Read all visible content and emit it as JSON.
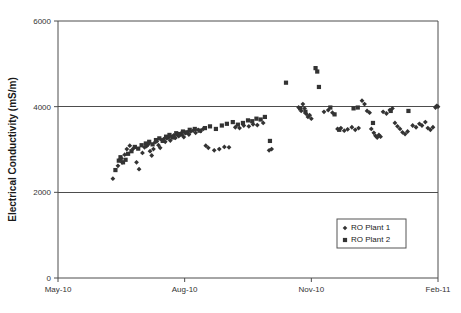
{
  "chart_data": {
    "type": "scatter",
    "title": "",
    "xlabel": "",
    "ylabel": "Electrical Conductivity (mS/m)",
    "grid": true,
    "legend_position": "inside-bottom-right",
    "ylim": [
      0,
      6000
    ],
    "y_ticks": [
      0,
      2000,
      4000,
      6000
    ],
    "y_tick_labels": [
      "0",
      "2000",
      "4000",
      "6000"
    ],
    "x_ticks": [
      0,
      3,
      6,
      9
    ],
    "x_tick_labels": [
      "May-10",
      "Aug-10",
      "Nov-10",
      "Feb-11"
    ],
    "xlim": [
      0,
      9
    ],
    "x_unit": "months since May-10",
    "series": [
      {
        "name": "RO Plant 1",
        "marker": "diamond",
        "color": "#333333",
        "points": [
          [
            1.3,
            2320
          ],
          [
            1.42,
            2620
          ],
          [
            1.46,
            2760
          ],
          [
            1.5,
            2790
          ],
          [
            1.52,
            2700
          ],
          [
            1.58,
            2880
          ],
          [
            1.63,
            3010
          ],
          [
            1.7,
            3090
          ],
          [
            1.78,
            3020
          ],
          [
            1.86,
            2700
          ],
          [
            1.92,
            2540
          ],
          [
            2.0,
            2920
          ],
          [
            2.05,
            3050
          ],
          [
            2.1,
            3080
          ],
          [
            2.14,
            3120
          ],
          [
            2.18,
            2960
          ],
          [
            2.22,
            2860
          ],
          [
            2.26,
            3010
          ],
          [
            2.3,
            3170
          ],
          [
            2.34,
            3190
          ],
          [
            2.38,
            3100
          ],
          [
            2.42,
            3040
          ],
          [
            2.46,
            3220
          ],
          [
            2.5,
            3240
          ],
          [
            2.54,
            3180
          ],
          [
            2.58,
            3260
          ],
          [
            2.62,
            3280
          ],
          [
            2.66,
            3210
          ],
          [
            2.7,
            3300
          ],
          [
            2.74,
            3330
          ],
          [
            2.78,
            3270
          ],
          [
            2.82,
            3350
          ],
          [
            2.86,
            3310
          ],
          [
            2.9,
            3370
          ],
          [
            2.94,
            3340
          ],
          [
            2.98,
            3290
          ],
          [
            3.02,
            3380
          ],
          [
            3.06,
            3400
          ],
          [
            3.1,
            3350
          ],
          [
            3.14,
            3420
          ],
          [
            3.2,
            3440
          ],
          [
            3.26,
            3390
          ],
          [
            3.32,
            3460
          ],
          [
            3.38,
            3430
          ],
          [
            3.44,
            3480
          ],
          [
            3.5,
            3090
          ],
          [
            3.56,
            3040
          ],
          [
            3.7,
            2980
          ],
          [
            3.82,
            3010
          ],
          [
            3.94,
            3060
          ],
          [
            4.05,
            3050
          ],
          [
            4.2,
            3520
          ],
          [
            4.3,
            3500
          ],
          [
            4.4,
            3560
          ],
          [
            4.52,
            3540
          ],
          [
            4.62,
            3590
          ],
          [
            4.72,
            3570
          ],
          [
            4.86,
            3620
          ],
          [
            5.0,
            2980
          ],
          [
            5.06,
            3010
          ],
          [
            5.7,
            3980
          ],
          [
            5.76,
            3900
          ],
          [
            5.8,
            4060
          ],
          [
            5.84,
            3960
          ],
          [
            5.88,
            3830
          ],
          [
            5.92,
            3760
          ],
          [
            5.96,
            3800
          ],
          [
            6.0,
            3720
          ],
          [
            6.3,
            3880
          ],
          [
            6.4,
            3920
          ],
          [
            6.5,
            3860
          ],
          [
            6.62,
            3480
          ],
          [
            6.7,
            3500
          ],
          [
            6.78,
            3440
          ],
          [
            6.86,
            3470
          ],
          [
            6.96,
            3520
          ],
          [
            7.04,
            3460
          ],
          [
            7.12,
            3500
          ],
          [
            7.2,
            4140
          ],
          [
            7.26,
            4060
          ],
          [
            7.32,
            3900
          ],
          [
            7.38,
            3860
          ],
          [
            7.42,
            3480
          ],
          [
            7.48,
            3390
          ],
          [
            7.52,
            3320
          ],
          [
            7.56,
            3280
          ],
          [
            7.6,
            3340
          ],
          [
            7.64,
            3300
          ],
          [
            7.7,
            3880
          ],
          [
            7.78,
            3840
          ],
          [
            7.86,
            3920
          ],
          [
            7.92,
            3960
          ],
          [
            7.98,
            3620
          ],
          [
            8.04,
            3540
          ],
          [
            8.1,
            3480
          ],
          [
            8.16,
            3400
          ],
          [
            8.22,
            3360
          ],
          [
            8.28,
            3420
          ],
          [
            8.4,
            3560
          ],
          [
            8.48,
            3520
          ],
          [
            8.56,
            3600
          ],
          [
            8.62,
            3560
          ],
          [
            8.7,
            3640
          ],
          [
            8.76,
            3500
          ],
          [
            8.82,
            3460
          ],
          [
            8.88,
            3520
          ],
          [
            8.94,
            3980
          ],
          [
            8.97,
            4020
          ],
          [
            9.0,
            4000
          ]
        ]
      },
      {
        "name": "RO Plant 2",
        "marker": "square",
        "color": "#333333",
        "points": [
          [
            1.36,
            2520
          ],
          [
            1.44,
            2740
          ],
          [
            1.48,
            2820
          ],
          [
            1.54,
            2700
          ],
          [
            1.6,
            2760
          ],
          [
            1.66,
            2900
          ],
          [
            1.74,
            2960
          ],
          [
            1.82,
            3060
          ],
          [
            1.9,
            3020
          ],
          [
            1.98,
            3100
          ],
          [
            2.08,
            3140
          ],
          [
            2.16,
            3180
          ],
          [
            2.24,
            3120
          ],
          [
            2.32,
            3220
          ],
          [
            2.4,
            3260
          ],
          [
            2.48,
            3200
          ],
          [
            2.56,
            3300
          ],
          [
            2.64,
            3340
          ],
          [
            2.72,
            3280
          ],
          [
            2.8,
            3380
          ],
          [
            2.88,
            3360
          ],
          [
            2.96,
            3420
          ],
          [
            3.04,
            3400
          ],
          [
            3.12,
            3460
          ],
          [
            3.24,
            3480
          ],
          [
            3.36,
            3440
          ],
          [
            3.48,
            3500
          ],
          [
            3.6,
            3540
          ],
          [
            3.74,
            3480
          ],
          [
            3.88,
            3560
          ],
          [
            4.0,
            3600
          ],
          [
            4.14,
            3640
          ],
          [
            4.26,
            3580
          ],
          [
            4.38,
            3620
          ],
          [
            4.5,
            3680
          ],
          [
            4.6,
            3660
          ],
          [
            4.7,
            3720
          ],
          [
            4.8,
            3700
          ],
          [
            4.9,
            3760
          ],
          [
            5.02,
            3200
          ],
          [
            5.4,
            4560
          ],
          [
            5.74,
            3960
          ],
          [
            5.86,
            3880
          ],
          [
            6.1,
            4900
          ],
          [
            6.14,
            4820
          ],
          [
            6.18,
            4460
          ],
          [
            6.45,
            3980
          ],
          [
            6.55,
            3820
          ],
          [
            6.66,
            3460
          ],
          [
            7.0,
            3960
          ],
          [
            7.1,
            3980
          ],
          [
            7.46,
            3620
          ],
          [
            7.88,
            3900
          ],
          [
            8.3,
            3900
          ]
        ]
      }
    ]
  },
  "axes": {
    "y_title": "Electrical Conductivity (mS/m)"
  },
  "legend": {
    "entries": [
      {
        "label": "RO Plant 1",
        "marker": "diamond"
      },
      {
        "label": "RO Plant 2",
        "marker": "square"
      }
    ]
  },
  "colors": {
    "marker": "#333333",
    "axis": "#4d4d4d",
    "text": "#1a1a1a",
    "background": "#ffffff"
  },
  "geometry": {
    "plot_left": 58,
    "plot_right": 438,
    "plot_top": 21,
    "plot_bottom": 278,
    "legend_x": 337,
    "legend_y": 219,
    "legend_w": 69,
    "legend_h": 29
  }
}
